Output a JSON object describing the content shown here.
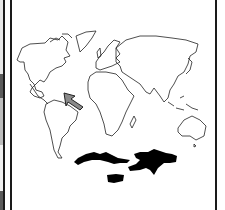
{
  "figure": {
    "type": "world-map-outline",
    "highlight": "caribbean",
    "arrow": {
      "color": "#8a8a8a",
      "outline": "#222222",
      "points_to": "caribbean"
    },
    "inset": {
      "content": "caribbean-islands",
      "fill": "#000000",
      "islands": [
        "cuba",
        "hispaniola",
        "jamaica"
      ]
    }
  },
  "colors": {
    "background": "#ffffff",
    "outline": "#222222",
    "border": "#1a1a1a",
    "strip_gray": "#5a5a5a"
  }
}
